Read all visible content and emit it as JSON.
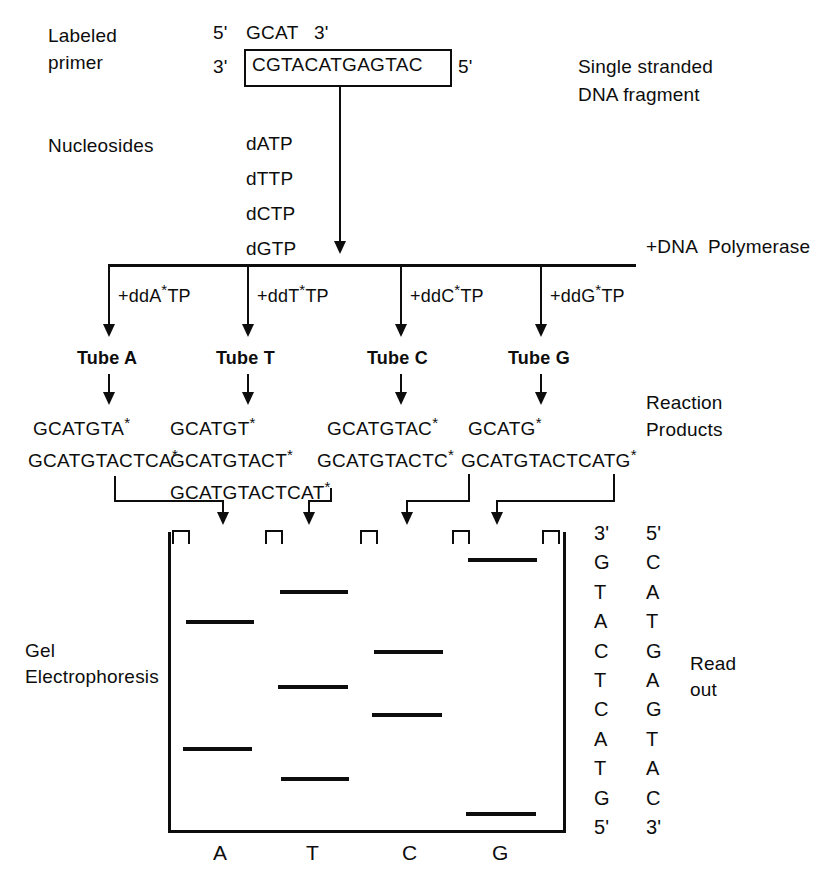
{
  "top": {
    "labeled_primer_line1": "Labeled",
    "labeled_primer_line2": "primer",
    "primer_five_prime": "5'",
    "primer_seq": "GCAT",
    "primer_three_prime": "3'",
    "template_three_prime": "3'",
    "template_seq": "CGTACATGAGTAC",
    "template_five_prime": "5'",
    "fragment_line1": "Single stranded",
    "fragment_line2": "DNA fragment"
  },
  "nucleosides": {
    "label": "Nucleosides",
    "items": [
      "dATP",
      "dTTP",
      "dCTP",
      "dGTP"
    ],
    "polymerase_label": "+DNA  Polymerase"
  },
  "reactions": {
    "terminators": [
      {
        "prefix": "+ddA",
        "star": "*",
        "suffix": "TP"
      },
      {
        "prefix": "+ddT",
        "star": "*",
        "suffix": "TP"
      },
      {
        "prefix": "+ddC",
        "star": "*",
        "suffix": "TP"
      },
      {
        "prefix": "+ddG",
        "star": "*",
        "suffix": "TP"
      }
    ],
    "tubes": [
      "Tube A",
      "Tube T",
      "Tube C",
      "Tube G"
    ],
    "products_label_line1": "Reaction",
    "products_label_line2": "Products",
    "products": {
      "A": [
        "GCATGTA",
        "GCATGTACTCA"
      ],
      "T": [
        "GCATGT",
        "GCATGTACT",
        "GCATGTACTCAT"
      ],
      "C": [
        "GCATGTAC",
        "GCATGTACTC"
      ],
      "G": [
        "GCATG",
        "GCATGTACTCATG"
      ]
    },
    "star_marker": "*"
  },
  "gel": {
    "label_line1": "Gel",
    "label_line2": "Electrophoresis",
    "lane_labels": [
      "A",
      "T",
      "C",
      "G"
    ],
    "bands": {
      "A": [
        620,
        747
      ],
      "T": [
        590,
        685,
        777
      ],
      "C": [
        650,
        713
      ],
      "G": [
        558,
        812
      ]
    }
  },
  "readout": {
    "label_line1": "Read",
    "label_line2": "out",
    "left_column": [
      "3'",
      "G",
      "T",
      "A",
      "C",
      "T",
      "C",
      "A",
      "T",
      "G",
      "5'"
    ],
    "right_column": [
      "5'",
      "C",
      "A",
      "T",
      "G",
      "A",
      "G",
      "T",
      "A",
      "C",
      "3'"
    ]
  },
  "colors": {
    "ink": "#0d0d0d",
    "paper": "#ffffff"
  }
}
